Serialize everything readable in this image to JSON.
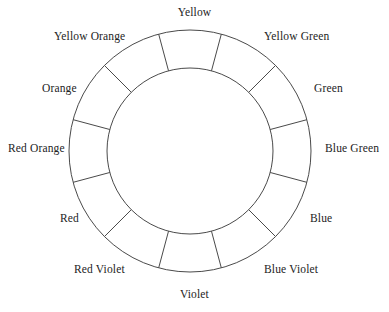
{
  "figure": {
    "name": "color-wheel-diagram",
    "caption": "",
    "background_color": "#ffffff",
    "stroke_color": "#4a4a4a",
    "label_color": "#232323"
  },
  "wheel": {
    "center_x": 190,
    "center_y": 151,
    "outer_radius": 121,
    "inner_radius": 83,
    "segment_count": 12,
    "segment_degrees": 30
  },
  "labels": [
    {
      "text": "Yellow",
      "angle_deg": 0,
      "left": 180,
      "top": 6,
      "align": "center"
    },
    {
      "text": "Yellow Green",
      "angle_deg": 30,
      "left": 264,
      "top": 30,
      "align": "left"
    },
    {
      "text": "Green",
      "angle_deg": 60,
      "left": 314,
      "top": 82,
      "align": "left"
    },
    {
      "text": "Blue Green",
      "angle_deg": 90,
      "left": 325,
      "top": 142,
      "align": "left"
    },
    {
      "text": "Blue",
      "angle_deg": 120,
      "left": 310,
      "top": 212,
      "align": "left"
    },
    {
      "text": "Blue Violet",
      "angle_deg": 150,
      "left": 264,
      "top": 263,
      "align": "left"
    },
    {
      "text": "Violet",
      "angle_deg": 180,
      "left": 180,
      "top": 288,
      "align": "center"
    },
    {
      "text": "Red Violet",
      "angle_deg": 210,
      "left": 74,
      "top": 263,
      "align": "left"
    },
    {
      "text": "Red",
      "angle_deg": 240,
      "left": 60,
      "top": 212,
      "align": "left"
    },
    {
      "text": "Red Orange",
      "angle_deg": 270,
      "left": 8,
      "top": 142,
      "align": "left"
    },
    {
      "text": "Orange",
      "angle_deg": 300,
      "left": 42,
      "top": 82,
      "align": "left"
    },
    {
      "text": "Yellow Orange",
      "angle_deg": 330,
      "left": 54,
      "top": 30,
      "align": "left"
    }
  ]
}
